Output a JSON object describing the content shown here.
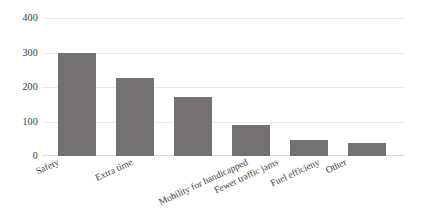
{
  "chart_data": {
    "type": "bar",
    "title": "",
    "subtitle": "",
    "xlabel": "",
    "ylabel": "",
    "categories": [
      "Safety",
      "Extra time",
      "Mobility for handicapped",
      "Fewer traffic jams",
      "Fuel efficieny",
      "Other"
    ],
    "values": [
      300,
      225,
      170,
      90,
      45,
      38
    ],
    "ylim": [
      0,
      400
    ],
    "yticks": [
      0,
      100,
      200,
      300,
      400
    ],
    "ytick_labels": [
      "0",
      "100",
      "200",
      "300",
      "400"
    ],
    "grid": true,
    "legend": false,
    "legend_position": "none",
    "bar_color": "#767171",
    "gridline_color": "#e8e8e8",
    "text_color": "#3b3b3b",
    "background": "#ffffff"
  }
}
